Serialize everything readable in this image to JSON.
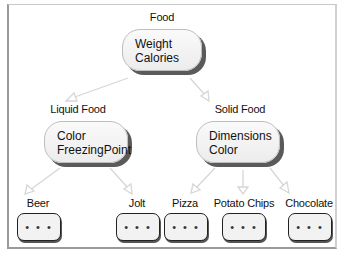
{
  "diagram": {
    "root": {
      "title": "Food",
      "attributes": [
        "Weight",
        "Calories"
      ]
    },
    "level2": [
      {
        "title": "Liquid Food",
        "attributes": [
          "Color",
          "FreezingPoint"
        ]
      },
      {
        "title": "Solid Food",
        "attributes": [
          "Dimensions",
          "Color"
        ]
      }
    ],
    "leaves": [
      {
        "title": "Beer",
        "content": "• • •",
        "parent": "Liquid Food"
      },
      {
        "title": "Jolt",
        "content": "• • •",
        "parent": "Liquid Food"
      },
      {
        "title": "Pizza",
        "content": "• • •",
        "parent": "Solid Food"
      },
      {
        "title": "Potato Chips",
        "content": "• • •",
        "parent": "Solid Food"
      },
      {
        "title": "Chocolate",
        "content": "• • •",
        "parent": "Solid Food"
      }
    ]
  },
  "colors": {
    "node_fill": "#f2f2f2",
    "node_shadow": "#5a5a5a",
    "arrow": "#d8d8d8",
    "leaf_border": "#222222"
  }
}
